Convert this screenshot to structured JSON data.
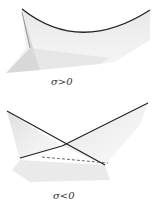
{
  "figure": {
    "panels": [
      {
        "id": "top",
        "label": "σ>0",
        "surface": "fold-surface"
      },
      {
        "id": "bottom",
        "label": "σ<0",
        "surface": "self-intersecting-surface"
      }
    ],
    "colors": {
      "curve": "#222222",
      "shade": "#bdbdbd"
    }
  }
}
